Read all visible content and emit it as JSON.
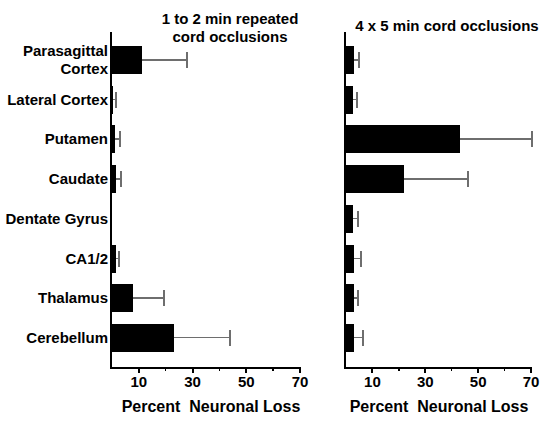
{
  "page": {
    "background_color": "#ffffff",
    "text_color": "#000000"
  },
  "chart_data": [
    {
      "type": "bar",
      "orientation": "horizontal",
      "title": "1 to 2 min repeated\ncord occlusions",
      "xlabel": "Percent  Neuronal Loss",
      "categories": [
        "Parasagittal Cortex",
        "Lateral Cortex",
        "Putamen",
        "Caudate",
        "Dentate Gyrus",
        "CA1/2",
        "Thalamus",
        "Cerebellum"
      ],
      "category_lines": [
        [
          "Parasagittal",
          "Cortex"
        ],
        [
          "Lateral Cortex"
        ],
        [
          "Putamen"
        ],
        [
          "Caudate"
        ],
        [
          "Dentate Gyrus"
        ],
        [
          "CA1/2"
        ],
        [
          "Thalamus"
        ],
        [
          "Cerebellum"
        ]
      ],
      "values": [
        11,
        0.5,
        1,
        1.5,
        0,
        1.5,
        8,
        23
      ],
      "error_upper_tips": [
        28,
        1.5,
        3,
        3.5,
        0,
        2.5,
        19.5,
        44
      ],
      "xlim": [
        0,
        70
      ],
      "xticks_labeled": [
        10,
        30,
        50,
        70
      ],
      "xticks_minor": [
        20,
        40,
        60
      ],
      "grid": false,
      "bar_color": "#000000",
      "error_color": "#6e6e6e",
      "axis_color": "#000000"
    },
    {
      "type": "bar",
      "orientation": "horizontal",
      "title": "4 x 5 min cord occlusions",
      "xlabel": "Percent  Neuronal Loss",
      "categories": [
        "Parasagittal Cortex",
        "Lateral Cortex",
        "Putamen",
        "Caudate",
        "Dentate Gyrus",
        "CA1/2",
        "Thalamus",
        "Cerebellum"
      ],
      "values": [
        3,
        2.5,
        43,
        22,
        2.5,
        3,
        3,
        3
      ],
      "error_upper_tips": [
        5,
        4,
        70.5,
        46,
        4.5,
        5.5,
        4.5,
        6.5
      ],
      "xlim": [
        0,
        70
      ],
      "xticks_labeled": [
        10,
        30,
        50,
        70
      ],
      "xticks_minor": [
        20,
        40,
        60
      ],
      "grid": false,
      "bar_color": "#000000",
      "error_color": "#6e6e6e",
      "axis_color": "#000000"
    }
  ]
}
